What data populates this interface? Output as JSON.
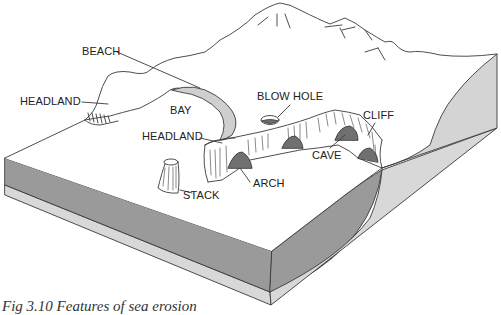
{
  "figure": {
    "caption": "Fig 3.10 Features of sea erosion",
    "title": "Features of sea erosion"
  },
  "labels": {
    "beach": "BEACH",
    "headland_left": "HEADLAND",
    "bay": "BAY",
    "blow_hole": "BLOW HOLE",
    "headland_center": "HEADLAND",
    "cliff": "CLIFF",
    "cave": "CAVE",
    "arch": "ARCH",
    "stack": "STACK"
  },
  "colors": {
    "outline": "#3a3a3a",
    "top_surface": "#ffffff",
    "dark_layer": "#9a9a9a",
    "light_layer": "#d8d8d8",
    "right_face": "#d4d4d4",
    "beach_sand": "#cfcfcf",
    "cave_shadow": "#707070"
  }
}
